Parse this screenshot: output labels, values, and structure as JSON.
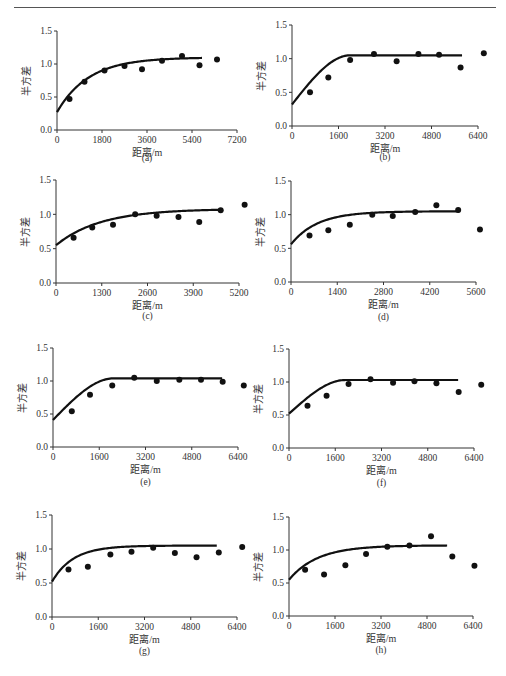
{
  "page": {
    "header_text": "",
    "figure_caption": ""
  },
  "axes_common": {
    "ylabel": "半方差",
    "xlabel": "距离/m",
    "yticks": [
      "0.0",
      "0.5",
      "1.0",
      "1.5"
    ]
  },
  "chart_data": [
    {
      "panel": "(a)",
      "type": "scatter",
      "title": "",
      "xlabel": "距离/m",
      "ylabel": "半方差",
      "xlim": [
        0,
        7200
      ],
      "ylim": [
        0,
        1.5
      ],
      "xticks": [
        0,
        1800,
        3600,
        5400,
        7200
      ],
      "yticks": [
        0.0,
        0.5,
        1.0,
        1.5
      ],
      "series": [
        {
          "name": "experimental",
          "x": [
            500,
            1100,
            1900,
            2700,
            3400,
            4200,
            5000,
            5700,
            6400
          ],
          "y": [
            0.47,
            0.73,
            0.9,
            0.97,
            0.92,
            1.05,
            1.12,
            0.98,
            1.07
          ]
        },
        {
          "name": "model",
          "kind": "exponential",
          "nugget": 0.27,
          "sill": 1.1,
          "range": 3800,
          "xmax": 5800
        }
      ]
    },
    {
      "panel": "(b)",
      "type": "scatter",
      "title": "",
      "xlabel": "距离/m",
      "ylabel": "半方差",
      "xlim": [
        0,
        6400
      ],
      "ylim": [
        0,
        1.5
      ],
      "xticks": [
        0,
        1600,
        3200,
        4800,
        6400
      ],
      "yticks": [
        0.0,
        0.5,
        1.0,
        1.5
      ],
      "series": [
        {
          "name": "experimental",
          "x": [
            620,
            1250,
            2000,
            2820,
            3600,
            4350,
            5060,
            5800,
            6600
          ],
          "y": [
            0.5,
            0.72,
            0.98,
            1.07,
            0.96,
            1.07,
            1.06,
            0.87,
            1.08
          ]
        },
        {
          "name": "model",
          "kind": "spherical",
          "nugget": 0.32,
          "sill": 1.05,
          "range": 2000,
          "xmax": 5900
        }
      ]
    },
    {
      "panel": "(c)",
      "type": "scatter",
      "title": "",
      "xlabel": "距离/m",
      "ylabel": "半方差",
      "xlim": [
        0,
        5200
      ],
      "ylim": [
        0,
        1.5
      ],
      "xticks": [
        0,
        1300,
        2600,
        3900,
        5200
      ],
      "yticks": [
        0.0,
        0.5,
        1.0,
        1.5
      ],
      "series": [
        {
          "name": "experimental",
          "x": [
            500,
            1030,
            1620,
            2250,
            2860,
            3480,
            4070,
            4680,
            5360
          ],
          "y": [
            0.66,
            0.81,
            0.85,
            1.0,
            0.98,
            0.96,
            0.89,
            1.06,
            1.14
          ]
        },
        {
          "name": "model",
          "kind": "exponential",
          "nugget": 0.55,
          "sill": 1.08,
          "range": 3800,
          "xmax": 4700
        }
      ]
    },
    {
      "panel": "(d)",
      "type": "scatter",
      "title": "",
      "xlabel": "距离/m",
      "ylabel": "半方差",
      "xlim": [
        0,
        5600
      ],
      "ylim": [
        0,
        1.5
      ],
      "xticks": [
        0,
        1400,
        2800,
        4200,
        5600
      ],
      "yticks": [
        0.0,
        0.5,
        1.0,
        1.5
      ],
      "series": [
        {
          "name": "experimental",
          "x": [
            560,
            1130,
            1780,
            2460,
            3080,
            3760,
            4400,
            5060,
            5720
          ],
          "y": [
            0.69,
            0.77,
            0.85,
            1.0,
            0.98,
            1.04,
            1.14,
            1.07,
            0.78
          ]
        },
        {
          "name": "model",
          "kind": "exponential",
          "nugget": 0.56,
          "sill": 1.05,
          "range": 2400,
          "xmax": 5100
        }
      ]
    },
    {
      "panel": "(e)",
      "type": "scatter",
      "title": "",
      "xlabel": "距离/m",
      "ylabel": "半方差",
      "xlim": [
        0,
        6400
      ],
      "ylim": [
        0,
        1.5
      ],
      "xticks": [
        0,
        1600,
        3200,
        4800,
        6400
      ],
      "yticks": [
        0.0,
        0.5,
        1.0,
        1.5
      ],
      "series": [
        {
          "name": "experimental",
          "x": [
            650,
            1280,
            2050,
            2810,
            3590,
            4370,
            5120,
            5870,
            6600
          ],
          "y": [
            0.54,
            0.79,
            0.93,
            1.05,
            1.0,
            1.02,
            1.02,
            0.99,
            0.93
          ]
        },
        {
          "name": "model",
          "kind": "spherical",
          "nugget": 0.41,
          "sill": 1.04,
          "range": 2100,
          "xmax": 5900
        }
      ]
    },
    {
      "panel": "(f)",
      "type": "scatter",
      "title": "",
      "xlabel": "距离/m",
      "ylabel": "半方差",
      "xlim": [
        0,
        6400
      ],
      "ylim": [
        0,
        1.5
      ],
      "xticks": [
        0,
        1600,
        3200,
        4800,
        6400
      ],
      "yticks": [
        0.0,
        0.5,
        1.0,
        1.5
      ],
      "series": [
        {
          "name": "experimental",
          "x": [
            640,
            1300,
            2060,
            2820,
            3600,
            4340,
            5100,
            5870,
            6650
          ],
          "y": [
            0.64,
            0.79,
            0.97,
            1.04,
            0.99,
            1.01,
            0.98,
            0.85,
            0.96
          ]
        },
        {
          "name": "model",
          "kind": "spherical",
          "nugget": 0.52,
          "sill": 1.03,
          "range": 1950,
          "xmax": 5900
        }
      ]
    },
    {
      "panel": "(g)",
      "type": "scatter",
      "title": "",
      "xlabel": "距离/m",
      "ylabel": "半方差",
      "xlim": [
        0,
        6400
      ],
      "ylim": [
        0,
        1.5
      ],
      "xticks": [
        0,
        1600,
        3200,
        4800,
        6400
      ],
      "yticks": [
        0.0,
        0.5,
        1.0,
        1.5
      ],
      "series": [
        {
          "name": "experimental",
          "x": [
            570,
            1240,
            2020,
            2750,
            3500,
            4250,
            5000,
            5770,
            6580
          ],
          "y": [
            0.7,
            0.74,
            0.92,
            0.96,
            1.02,
            0.94,
            0.88,
            0.95,
            1.03
          ]
        },
        {
          "name": "model",
          "kind": "exponential",
          "nugget": 0.52,
          "sill": 1.05,
          "range": 2200,
          "xmax": 5700
        }
      ]
    },
    {
      "panel": "(h)",
      "type": "scatter",
      "title": "",
      "xlabel": "距离/m",
      "ylabel": "半方差",
      "xlim": [
        0,
        6400
      ],
      "ylim": [
        0,
        1.5
      ],
      "xticks": [
        0,
        1600,
        3200,
        4800,
        6400
      ],
      "yticks": [
        0.0,
        0.5,
        1.0,
        1.5
      ],
      "series": [
        {
          "name": "experimental",
          "x": [
            560,
            1220,
            1960,
            2680,
            3420,
            4190,
            4940,
            5680,
            6450
          ],
          "y": [
            0.7,
            0.63,
            0.77,
            0.94,
            1.05,
            1.07,
            1.21,
            0.9,
            0.76
          ]
        },
        {
          "name": "model",
          "kind": "exponential",
          "nugget": 0.55,
          "sill": 1.07,
          "range": 3000,
          "xmax": 5500
        }
      ]
    }
  ],
  "layout": {
    "panels": [
      {
        "x0": 57,
        "x1": 237,
        "ytop": 31,
        "ybot": 130,
        "cap_y": 161
      },
      {
        "x0": 292,
        "x1": 478,
        "ytop": 25,
        "ybot": 126,
        "cap_y": 160
      },
      {
        "x0": 56,
        "x1": 239,
        "ytop": 180,
        "ybot": 283,
        "cap_y": 319
      },
      {
        "x0": 291,
        "x1": 476,
        "ytop": 181,
        "ybot": 282,
        "cap_y": 320
      },
      {
        "x0": 53,
        "x1": 238,
        "ytop": 348,
        "ybot": 447,
        "cap_y": 485
      },
      {
        "x0": 289,
        "x1": 474,
        "ytop": 349,
        "ybot": 448,
        "cap_y": 486
      },
      {
        "x0": 52,
        "x1": 237,
        "ytop": 515,
        "ybot": 617,
        "cap_y": 654
      },
      {
        "x0": 289,
        "x1": 473,
        "ytop": 517,
        "ybot": 616,
        "cap_y": 653
      }
    ]
  }
}
